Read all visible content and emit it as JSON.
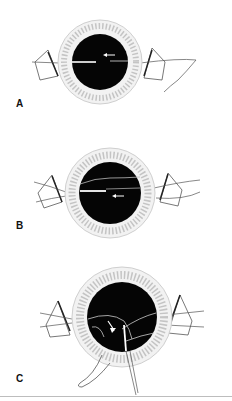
{
  "figure": {
    "panels": [
      {
        "label": "A",
        "description": "Eye with speculum; straight suture/instrument passing horizontally across pupil, arrow pointing left"
      },
      {
        "label": "B",
        "description": "Eye with speculum; curved suture across pupil, instrument entering from left, arrow pointing left"
      },
      {
        "label": "C",
        "description": "Eye with speculum; curved sutures within pupil, curved arrow downward, loop exiting inferiorly"
      }
    ],
    "colors": {
      "pupil": "#050505",
      "limbus_ring": "#d9d9d9",
      "line_art": "#444444",
      "background": "#ffffff"
    }
  }
}
